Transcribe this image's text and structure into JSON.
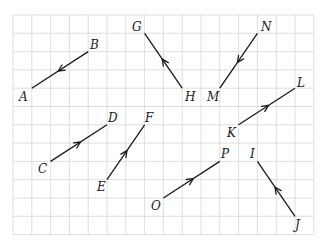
{
  "diagram": {
    "grid": {
      "origin_x": 13,
      "origin_y": 15,
      "cell_w": 18.8,
      "cell_h": 18.3,
      "cols": 16,
      "rows": 12,
      "line_color": "#d6d6d6"
    },
    "ink_color": "#1a1a1a",
    "vectors": [
      {
        "name": "BA",
        "from": "B",
        "to": "A",
        "from_pt": [
          4,
          2
        ],
        "to_pt": [
          1,
          4
        ]
      },
      {
        "name": "HG",
        "from": "H",
        "to": "G",
        "from_pt": [
          9,
          4
        ],
        "to_pt": [
          7,
          1
        ]
      },
      {
        "name": "NM",
        "from": "N",
        "to": "M",
        "from_pt": [
          13,
          1
        ],
        "to_pt": [
          11,
          4
        ]
      },
      {
        "name": "KL",
        "from": "K",
        "to": "L",
        "from_pt": [
          12,
          6
        ],
        "to_pt": [
          15,
          4
        ]
      },
      {
        "name": "CD",
        "from": "C",
        "to": "D",
        "from_pt": [
          2,
          8
        ],
        "to_pt": [
          5,
          6
        ]
      },
      {
        "name": "EF",
        "from": "E",
        "to": "F",
        "from_pt": [
          5,
          9
        ],
        "to_pt": [
          7,
          6
        ]
      },
      {
        "name": "OP",
        "from": "O",
        "to": "P",
        "from_pt": [
          8,
          10
        ],
        "to_pt": [
          11,
          8
        ]
      },
      {
        "name": "JI",
        "from": "J",
        "to": "I",
        "from_pt": [
          15,
          11
        ],
        "to_pt": [
          13,
          8
        ]
      }
    ],
    "labels": [
      {
        "text": "A",
        "x": 19,
        "y": 101
      },
      {
        "text": "B",
        "x": 90,
        "y": 49
      },
      {
        "text": "G",
        "x": 132,
        "y": 31
      },
      {
        "text": "H",
        "x": 185,
        "y": 101
      },
      {
        "text": "M",
        "x": 207,
        "y": 101
      },
      {
        "text": "N",
        "x": 261,
        "y": 31
      },
      {
        "text": "L",
        "x": 297,
        "y": 87
      },
      {
        "text": "K",
        "x": 227,
        "y": 137
      },
      {
        "text": "C",
        "x": 38,
        "y": 173
      },
      {
        "text": "D",
        "x": 108,
        "y": 122
      },
      {
        "text": "F",
        "x": 145,
        "y": 122
      },
      {
        "text": "E",
        "x": 97,
        "y": 191
      },
      {
        "text": "O",
        "x": 151,
        "y": 210
      },
      {
        "text": "P",
        "x": 221,
        "y": 158
      },
      {
        "text": "I",
        "x": 250,
        "y": 158
      },
      {
        "text": "J",
        "x": 295,
        "y": 229
      }
    ]
  }
}
